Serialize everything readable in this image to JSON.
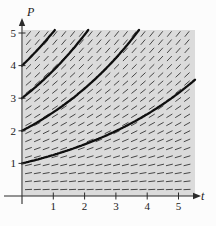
{
  "figure": {
    "plot_bg": "#dbdbdb",
    "page_bg": "#fcfcfc",
    "dash_color": "#474747",
    "curve_color": "#0f0f0f",
    "axis_color": "#2b2b2b",
    "label_color": "#1a1a1a"
  },
  "chart_data": {
    "type": "line",
    "xlabel": "t",
    "ylabel": "P",
    "xlim": [
      0,
      5.5
    ],
    "ylim": [
      0,
      5.1
    ],
    "x_ticks": [
      1,
      2,
      3,
      4,
      5
    ],
    "y_ticks": [
      1,
      2,
      3,
      4,
      5
    ],
    "grid": false,
    "legend": false,
    "slope_field": {
      "equation": "dP/dt = k*P",
      "k": 0.24,
      "rows": 20,
      "cols": 19,
      "dash_length_px": 7
    },
    "series": [
      {
        "name": "solution P(0)=1",
        "P0": 1,
        "k": 0.23
      },
      {
        "name": "solution P(0)=2",
        "P0": 2,
        "k": 0.25
      },
      {
        "name": "solution P(0)=3",
        "P0": 3,
        "k": 0.25
      },
      {
        "name": "solution P(0)=4",
        "P0": 4,
        "k": 0.23
      }
    ]
  }
}
